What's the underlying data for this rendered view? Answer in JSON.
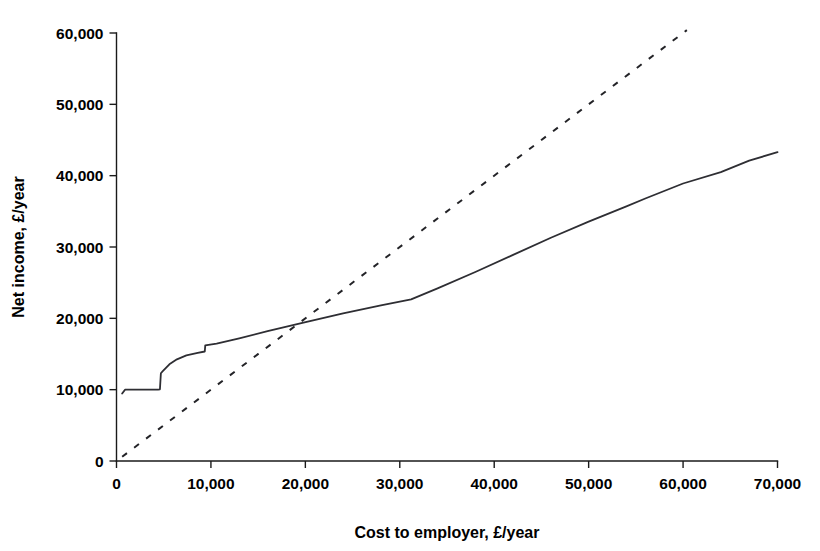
{
  "chart_data": {
    "type": "line",
    "title": "",
    "xlabel": "Cost to employer, £/year",
    "ylabel": "Net income, £/year",
    "xlim": [
      0,
      70000
    ],
    "ylim": [
      0,
      60000
    ],
    "xticks": [
      0,
      10000,
      20000,
      30000,
      40000,
      50000,
      60000,
      70000
    ],
    "xtick_labels": [
      "0",
      "10,000",
      "20,000",
      "30,000",
      "40,000",
      "50,000",
      "60,000",
      "70,000"
    ],
    "yticks": [
      0,
      10000,
      20000,
      30000,
      40000,
      50000,
      60000
    ],
    "ytick_labels": [
      "0",
      "10,000",
      "20,000",
      "30,000",
      "40,000",
      "50,000",
      "60,000"
    ],
    "grid": false,
    "legend": "none",
    "series": [
      {
        "name": "net-income-curve",
        "style": "solid",
        "color": "#2e2e33",
        "points": [
          [
            600,
            9450
          ],
          [
            900,
            10000
          ],
          [
            4400,
            10000
          ],
          [
            4600,
            10050
          ],
          [
            4700,
            12300
          ],
          [
            4900,
            12600
          ],
          [
            5600,
            13550
          ],
          [
            6400,
            14250
          ],
          [
            7400,
            14800
          ],
          [
            8600,
            15150
          ],
          [
            9350,
            15350
          ],
          [
            9400,
            16200
          ],
          [
            10600,
            16450
          ],
          [
            13000,
            17200
          ],
          [
            16000,
            18200
          ],
          [
            19800,
            19400
          ],
          [
            24000,
            20700
          ],
          [
            28000,
            21800
          ],
          [
            31200,
            22650
          ],
          [
            34000,
            24200
          ],
          [
            38000,
            26500
          ],
          [
            42000,
            28900
          ],
          [
            46000,
            31300
          ],
          [
            50000,
            33550
          ],
          [
            54000,
            35700
          ],
          [
            56000,
            36800
          ],
          [
            60000,
            38900
          ],
          [
            64000,
            40500
          ],
          [
            67000,
            42100
          ],
          [
            70000,
            43300
          ]
        ]
      },
      {
        "name": "gross-reference-line",
        "style": "dashed",
        "color": "#232327",
        "points": [
          [
            600,
            600
          ],
          [
            60400,
            60400
          ]
        ]
      }
    ]
  },
  "axes": {
    "x_axis_name": "x-axis",
    "y_axis_name": "y-axis"
  }
}
